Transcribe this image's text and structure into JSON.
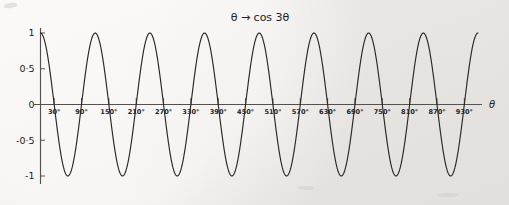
{
  "figure": {
    "title": "θ → cos 3θ",
    "background_color": "#f1efed",
    "ink_color": "#2a2724"
  },
  "chart_data": {
    "type": "line",
    "title": "θ → cos 3θ",
    "function": "cos 3θ",
    "xlabel": "θ",
    "ylabel": "",
    "xlim": [
      0,
      960
    ],
    "ylim": [
      -1,
      1
    ],
    "grid": false,
    "legend": null,
    "x_unit": "degrees",
    "period_degrees": 120,
    "amplitude": 1,
    "cycles_shown": 8,
    "x_tick_labels": [
      "30°",
      "90°",
      "150°",
      "210°",
      "270°",
      "330°",
      "390°",
      "450°",
      "510°",
      "570°",
      "630°",
      "690°",
      "750°",
      "810°",
      "870°",
      "930°"
    ],
    "x_tick_values": [
      30,
      90,
      150,
      210,
      270,
      330,
      390,
      450,
      510,
      570,
      630,
      690,
      750,
      810,
      870,
      930
    ],
    "y_tick_labels": [
      "1",
      "0·5",
      "0",
      "-0·5",
      "-1"
    ],
    "y_tick_values": [
      1,
      0.5,
      0,
      -0.5,
      -1
    ],
    "maxima_at_degrees": [
      0,
      120,
      240,
      360,
      480,
      600,
      720,
      840,
      960
    ],
    "minima_at_degrees": [
      60,
      180,
      300,
      420,
      540,
      660,
      780,
      900
    ],
    "zeros_at_degrees": [
      30,
      90,
      150,
      210,
      270,
      330,
      390,
      450,
      510,
      570,
      630,
      690,
      750,
      810,
      870,
      930
    ],
    "series": [
      {
        "name": "cos 3θ",
        "x": [
          0,
          10,
          20,
          30,
          40,
          50,
          60,
          70,
          80,
          90,
          100,
          110,
          120,
          130,
          140,
          150,
          160,
          170,
          180,
          190,
          200,
          210,
          220,
          230,
          240,
          250,
          260,
          270,
          280,
          290,
          300,
          310,
          320,
          330,
          340,
          350,
          360,
          370,
          380,
          390,
          400,
          410,
          420,
          430,
          440,
          450,
          460,
          470,
          480,
          490,
          500,
          510,
          520,
          530,
          540,
          550,
          560,
          570,
          580,
          590,
          600,
          610,
          620,
          630,
          640,
          650,
          660,
          670,
          680,
          690,
          700,
          710,
          720,
          730,
          740,
          750,
          760,
          770,
          780,
          790,
          800,
          810,
          820,
          830,
          840,
          850,
          860,
          870,
          880,
          890,
          900,
          910,
          920,
          930,
          940,
          950,
          960
        ],
        "values": [
          1,
          0.866,
          0.5,
          0,
          -0.5,
          -0.866,
          -1,
          -0.866,
          -0.5,
          0,
          0.5,
          0.866,
          1,
          0.866,
          0.5,
          0,
          -0.5,
          -0.866,
          -1,
          -0.866,
          -0.5,
          0,
          0.5,
          0.866,
          1,
          0.866,
          0.5,
          0,
          -0.5,
          -0.866,
          -1,
          -0.866,
          -0.5,
          0,
          0.5,
          0.866,
          1,
          0.866,
          0.5,
          0,
          -0.5,
          -0.866,
          -1,
          -0.866,
          -0.5,
          0,
          0.5,
          0.866,
          1,
          0.866,
          0.5,
          0,
          -0.5,
          -0.866,
          -1,
          -0.866,
          -0.5,
          0,
          0.5,
          0.866,
          1,
          0.866,
          0.5,
          0,
          -0.5,
          -0.866,
          -1,
          -0.866,
          -0.5,
          0,
          0.5,
          0.866,
          1,
          0.866,
          0.5,
          0,
          -0.5,
          -0.866,
          -1,
          -0.866,
          -0.5,
          0,
          0.5,
          0.866,
          1,
          0.866,
          0.5,
          0,
          -0.5,
          -0.866,
          -1,
          -0.866,
          -0.5,
          0,
          0.5,
          0.866,
          1
        ]
      }
    ]
  }
}
